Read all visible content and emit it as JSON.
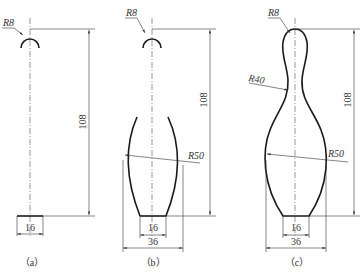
{
  "figures": [
    {
      "id": "a",
      "caption": "（a）",
      "labels": {
        "head_radius": "R8",
        "height": "108",
        "base_width": "16"
      }
    },
    {
      "id": "b",
      "caption": "（b）",
      "labels": {
        "head_radius": "R8",
        "height": "108",
        "body_radius": "R50",
        "base_width": "16",
        "body_width": "36"
      }
    },
    {
      "id": "c",
      "caption": "（c）",
      "labels": {
        "head_radius": "R8",
        "neck_radius": "R40",
        "height": "108",
        "body_radius": "R50",
        "base_width": "16",
        "body_width": "36"
      }
    }
  ],
  "colors": {
    "line": "#1a1a1a",
    "dimension": "#333333",
    "background": "#ffffff"
  }
}
